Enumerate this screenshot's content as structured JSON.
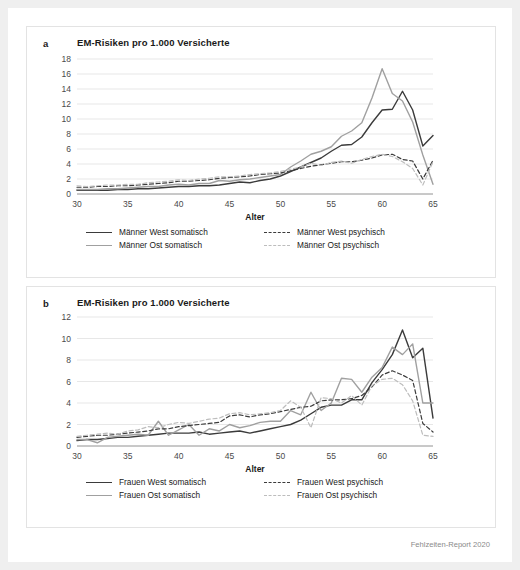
{
  "footer": {
    "source": "Fehlzeiten-Report 2020"
  },
  "colors": {
    "somatisch_west": "#3b3b3b",
    "somatisch_ost": "#a0a0a0",
    "psychisch_west": "#3b3b3b",
    "psychisch_ost": "#bdbdbd",
    "grid": "#dcdcdc",
    "axis": "#777777",
    "panel_border": "#e3e3e3",
    "page_background": "#efefef",
    "card_background": "#ffffff"
  },
  "panels": [
    {
      "letter": "a",
      "title": "EM-Risiken pro 1.000 Versicherte",
      "legend": [
        {
          "label": "Männer West somatisch",
          "style": "sw-dark-solid"
        },
        {
          "label": "Männer West psychisch",
          "style": "sw-dark-dash"
        },
        {
          "label": "Männer Ost somatisch",
          "style": "sw-gray-solid"
        },
        {
          "label": "Männer Ost psychisch",
          "style": "sw-gray-dash"
        }
      ]
    },
    {
      "letter": "b",
      "title": "EM-Risiken pro 1.000 Versicherte",
      "legend": [
        {
          "label": "Frauen West somatisch",
          "style": "sw-dark-solid"
        },
        {
          "label": "Frauen West psychisch",
          "style": "sw-dark-dash"
        },
        {
          "label": "Frauen Ost somatisch",
          "style": "sw-gray-solid"
        },
        {
          "label": "Frauen Ost psychisch",
          "style": "sw-gray-dash"
        }
      ]
    }
  ],
  "chart_data": [
    {
      "type": "line",
      "panel": "a",
      "title": "EM-Risiken pro 1.000 Versicherte",
      "xlabel": "Alter",
      "ylabel": "",
      "xlim": [
        30,
        65
      ],
      "ylim": [
        0,
        18
      ],
      "yticks": [
        0,
        2,
        4,
        6,
        8,
        10,
        12,
        14,
        16,
        18
      ],
      "xticks": [
        30,
        35,
        40,
        45,
        50,
        55,
        60,
        65
      ],
      "grid": true,
      "legend_position": "bottom",
      "x": [
        30,
        31,
        32,
        33,
        34,
        35,
        36,
        37,
        38,
        39,
        40,
        41,
        42,
        43,
        44,
        45,
        46,
        47,
        48,
        49,
        50,
        51,
        52,
        53,
        54,
        55,
        56,
        57,
        58,
        59,
        60,
        61,
        62,
        63,
        64,
        65
      ],
      "series": [
        {
          "name": "Männer West somatisch",
          "style": "solid",
          "color": "#3b3b3b",
          "values": [
            0.5,
            0.5,
            0.5,
            0.5,
            0.6,
            0.6,
            0.7,
            0.7,
            0.8,
            0.9,
            1.0,
            1.0,
            1.1,
            1.1,
            1.2,
            1.4,
            1.6,
            1.5,
            1.8,
            2.0,
            2.4,
            3.0,
            3.6,
            4.2,
            4.8,
            5.7,
            6.5,
            6.6,
            7.6,
            9.5,
            11.2,
            11.3,
            13.7,
            11.2,
            6.4,
            7.8
          ]
        },
        {
          "name": "Männer Ost somatisch",
          "style": "solid",
          "color": "#a0a0a0",
          "values": [
            0.6,
            0.6,
            0.6,
            0.7,
            0.7,
            0.8,
            0.9,
            1.0,
            1.0,
            1.2,
            1.3,
            1.2,
            1.4,
            1.4,
            1.8,
            1.7,
            1.9,
            2.0,
            2.2,
            2.4,
            2.6,
            3.6,
            4.4,
            5.3,
            5.7,
            6.3,
            7.7,
            8.4,
            9.5,
            12.8,
            16.7,
            13.4,
            12.4,
            9.6,
            5.2,
            1.3
          ]
        },
        {
          "name": "Männer West psychisch",
          "style": "dashed",
          "color": "#3b3b3b",
          "values": [
            0.9,
            0.9,
            1.0,
            1.0,
            1.1,
            1.1,
            1.2,
            1.3,
            1.4,
            1.5,
            1.7,
            1.7,
            1.8,
            1.9,
            2.1,
            2.2,
            2.3,
            2.4,
            2.6,
            2.7,
            2.8,
            3.1,
            3.4,
            3.7,
            3.9,
            4.1,
            4.3,
            4.3,
            4.5,
            4.8,
            5.2,
            5.3,
            4.6,
            4.4,
            2.0,
            4.5
          ]
        },
        {
          "name": "Männer Ost psychisch",
          "style": "dashed",
          "color": "#bdbdbd",
          "values": [
            1.1,
            1.0,
            1.1,
            1.2,
            1.2,
            1.3,
            1.3,
            1.5,
            1.6,
            1.7,
            1.9,
            1.8,
            2.0,
            2.1,
            2.3,
            2.3,
            2.4,
            2.6,
            2.7,
            2.8,
            3.0,
            3.3,
            3.6,
            4.1,
            3.8,
            4.2,
            4.4,
            4.1,
            4.6,
            5.0,
            5.3,
            5.0,
            4.3,
            3.4,
            1.2,
            4.3
          ]
        }
      ]
    },
    {
      "type": "line",
      "panel": "b",
      "title": "EM-Risiken pro 1.000 Versicherte",
      "xlabel": "Alter",
      "ylabel": "",
      "xlim": [
        30,
        65
      ],
      "ylim": [
        0,
        12
      ],
      "yticks": [
        0,
        2,
        4,
        6,
        8,
        10,
        12
      ],
      "xticks": [
        30,
        35,
        40,
        45,
        50,
        55,
        60,
        65
      ],
      "grid": true,
      "legend_position": "bottom",
      "x": [
        30,
        31,
        32,
        33,
        34,
        35,
        36,
        37,
        38,
        39,
        40,
        41,
        42,
        43,
        44,
        45,
        46,
        47,
        48,
        49,
        50,
        51,
        52,
        53,
        54,
        55,
        56,
        57,
        58,
        59,
        60,
        61,
        62,
        63,
        64,
        65
      ],
      "series": [
        {
          "name": "Frauen West somatisch",
          "style": "solid",
          "color": "#3b3b3b",
          "values": [
            0.5,
            0.6,
            0.6,
            0.7,
            0.8,
            0.8,
            0.9,
            1.0,
            1.1,
            1.2,
            1.2,
            1.2,
            1.3,
            1.1,
            1.2,
            1.3,
            1.4,
            1.2,
            1.4,
            1.6,
            1.8,
            2.0,
            2.4,
            3.0,
            3.6,
            3.8,
            3.8,
            4.3,
            4.3,
            5.9,
            7.1,
            8.5,
            10.8,
            8.2,
            9.1,
            2.6
          ]
        },
        {
          "name": "Frauen Ost somatisch",
          "style": "solid",
          "color": "#a0a0a0",
          "values": [
            0.6,
            0.6,
            0.3,
            0.8,
            0.9,
            1.0,
            1.1,
            1.0,
            2.3,
            1.0,
            1.5,
            2.0,
            1.0,
            1.6,
            1.4,
            2.0,
            1.7,
            1.9,
            2.2,
            2.3,
            2.3,
            3.3,
            2.9,
            5.0,
            3.3,
            4.0,
            6.3,
            6.2,
            5.0,
            6.4,
            7.3,
            9.2,
            8.5,
            9.5,
            4.0,
            4.0
          ]
        },
        {
          "name": "Frauen West psychisch",
          "style": "dashed",
          "color": "#3b3b3b",
          "values": [
            0.8,
            0.9,
            1.0,
            1.0,
            1.1,
            1.2,
            1.3,
            1.4,
            1.6,
            1.6,
            1.8,
            1.9,
            2.0,
            2.1,
            2.2,
            2.8,
            2.9,
            2.7,
            2.9,
            3.0,
            3.2,
            3.4,
            3.6,
            3.7,
            4.2,
            4.3,
            4.3,
            4.4,
            4.7,
            5.5,
            6.6,
            7.0,
            6.6,
            6.1,
            2.1,
            1.3
          ]
        },
        {
          "name": "Frauen Ost psychisch",
          "style": "dashed",
          "color": "#bdbdbd",
          "values": [
            0.9,
            1.0,
            1.1,
            1.2,
            1.1,
            1.4,
            1.5,
            1.8,
            1.7,
            2.0,
            2.2,
            2.1,
            2.3,
            2.5,
            2.6,
            3.0,
            3.1,
            2.9,
            3.0,
            3.1,
            3.3,
            4.2,
            3.6,
            1.7,
            4.5,
            4.4,
            4.0,
            4.7,
            3.8,
            5.6,
            6.2,
            6.3,
            5.7,
            4.2,
            1.0,
            0.9
          ]
        }
      ]
    }
  ]
}
